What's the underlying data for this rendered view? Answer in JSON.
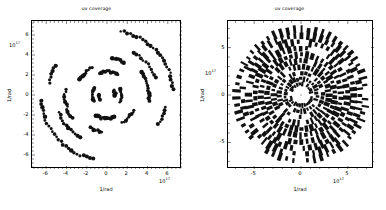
{
  "figure": {
    "background": "#ffffff",
    "marker_color": "#111111",
    "axis_color": "#000000",
    "width": 386,
    "height": 210
  },
  "panels": [
    {
      "id": "left",
      "title": "uv coverage",
      "xlabel": "1/rad",
      "ylabel": "1/rad",
      "x_exponent": "10^17",
      "y_exponent": "10^17",
      "xticks": [
        -6,
        -4,
        -2,
        0,
        2,
        4,
        6
      ],
      "yticks": [
        -6,
        -4,
        -2,
        0,
        2,
        4,
        6
      ],
      "xlim": [
        -7.4,
        7.4
      ],
      "ylim": [
        -7.4,
        7.4
      ],
      "minor_ticks_per_interval": 4,
      "ticks_all_sides": true,
      "marker_size": 1.6,
      "density": "sparse"
    },
    {
      "id": "right",
      "title": "uv coverage",
      "xlabel": "1/rad",
      "ylabel": "1/rad",
      "x_exponent": "10^17",
      "y_exponent": "10^17",
      "xticks": [
        -5,
        0,
        5
      ],
      "yticks": [
        -5,
        0,
        5
      ],
      "xlim": [
        -7.8,
        7.8
      ],
      "ylim": [
        -7.8,
        7.8
      ],
      "minor_ticks_per_interval": 4,
      "ticks_all_sides": true,
      "marker_size": 2.1,
      "density": "dense"
    }
  ],
  "chart_data": [
    {
      "type": "scatter",
      "panel": "left",
      "title": "uv coverage",
      "xlabel": "1/rad",
      "ylabel": "1/rad",
      "x_scale_exponent": 17,
      "y_scale_exponent": 17,
      "xlim": [
        -7.4,
        7.4
      ],
      "ylim": [
        -7.4,
        7.4
      ],
      "grid": false,
      "legend": null,
      "description": "Sparse uv-coverage: short arc segments distributed point-symmetrically about the origin; a large outer arc sweeps the right/upper-right, inner clusters near radius 1-3.",
      "arcs": [
        {
          "cx": 0.0,
          "cy": 0.0,
          "r": 6.55,
          "a0": 5,
          "a1": 78,
          "n": 26,
          "jitter": 0.12
        },
        {
          "cx": 0.0,
          "cy": 0.0,
          "r": 6.55,
          "a0": 185,
          "a1": 258,
          "n": 26,
          "jitter": 0.12
        },
        {
          "cx": 0.0,
          "cy": 0.0,
          "r": 5.05,
          "a0": 200,
          "a1": 238,
          "n": 12,
          "jitter": 0.12
        },
        {
          "cx": 0.0,
          "cy": 0.0,
          "r": 5.05,
          "a0": 20,
          "a1": 58,
          "n": 12,
          "jitter": 0.12
        },
        {
          "cx": 0.0,
          "cy": 0.0,
          "r": 4.15,
          "a0": 172,
          "a1": 214,
          "n": 13,
          "jitter": 0.1
        },
        {
          "cx": 0.0,
          "cy": 0.0,
          "r": 4.15,
          "a0": 352,
          "a1": 34,
          "n": 13,
          "jitter": 0.1
        },
        {
          "cx": 0.0,
          "cy": 0.0,
          "r": 3.1,
          "a0": 118,
          "a1": 150,
          "n": 9,
          "jitter": 0.1
        },
        {
          "cx": 0.0,
          "cy": 0.0,
          "r": 3.1,
          "a0": 298,
          "a1": 330,
          "n": 9,
          "jitter": 0.1
        },
        {
          "cx": 0.0,
          "cy": 0.0,
          "r": 2.35,
          "a0": 62,
          "a1": 108,
          "n": 11,
          "jitter": 0.09
        },
        {
          "cx": 0.0,
          "cy": 0.0,
          "r": 2.35,
          "a0": 242,
          "a1": 288,
          "n": 11,
          "jitter": 0.09
        },
        {
          "cx": 0.0,
          "cy": 0.0,
          "r": 1.45,
          "a0": 150,
          "a1": 205,
          "n": 9,
          "jitter": 0.08
        },
        {
          "cx": 0.0,
          "cy": 0.0,
          "r": 1.45,
          "a0": 330,
          "a1": 25,
          "n": 9,
          "jitter": 0.08
        },
        {
          "cx": 0.0,
          "cy": 0.0,
          "r": 0.8,
          "a0": 175,
          "a1": 215,
          "n": 6,
          "jitter": 0.07
        },
        {
          "cx": 0.0,
          "cy": 0.0,
          "r": 0.8,
          "a0": 355,
          "a1": 35,
          "n": 6,
          "jitter": 0.07
        },
        {
          "cx": 0.0,
          "cy": 0.0,
          "r": 5.85,
          "a0": 150,
          "a1": 168,
          "n": 7,
          "jitter": 0.1
        },
        {
          "cx": 0.0,
          "cy": 0.0,
          "r": 5.85,
          "a0": 330,
          "a1": 348,
          "n": 7,
          "jitter": 0.1
        },
        {
          "cx": 0.0,
          "cy": 0.0,
          "r": 3.7,
          "a0": 243,
          "a1": 262,
          "n": 7,
          "jitter": 0.09
        },
        {
          "cx": 0.0,
          "cy": 0.0,
          "r": 3.7,
          "a0": 63,
          "a1": 82,
          "n": 7,
          "jitter": 0.09
        }
      ],
      "point_count_estimate": 200
    },
    {
      "type": "scatter",
      "panel": "right",
      "title": "uv coverage",
      "xlabel": "1/rad",
      "ylabel": "1/rad",
      "x_scale_exponent": 17,
      "y_scale_exponent": 17,
      "xlim": [
        -7.8,
        7.8
      ],
      "ylim": [
        -7.8,
        7.8
      ],
      "grid": false,
      "legend": null,
      "description": "Dense uv-coverage: thick radially-oriented dashes arranged in concentric rings from radius ~1 out to ~7, nearly full azimuthal coverage with a small empty hole at the origin.",
      "rings": [
        {
          "r": 1.15,
          "n": 26,
          "a0": 0,
          "len": 0.38,
          "thick": 0.26
        },
        {
          "r": 1.7,
          "n": 30,
          "a0": 7,
          "len": 0.44,
          "thick": 0.28
        },
        {
          "r": 2.3,
          "n": 34,
          "a0": 3,
          "len": 0.5,
          "thick": 0.3
        },
        {
          "r": 2.95,
          "n": 38,
          "a0": 9,
          "len": 0.56,
          "thick": 0.31
        },
        {
          "r": 3.6,
          "n": 42,
          "a0": 5,
          "len": 0.6,
          "thick": 0.32
        },
        {
          "r": 4.25,
          "n": 46,
          "a0": 11,
          "len": 0.64,
          "thick": 0.33
        },
        {
          "r": 4.95,
          "n": 50,
          "a0": 4,
          "len": 0.68,
          "thick": 0.33
        },
        {
          "r": 5.6,
          "n": 54,
          "a0": 13,
          "len": 0.7,
          "thick": 0.33
        },
        {
          "r": 6.25,
          "n": 56,
          "a0": 6,
          "len": 0.72,
          "thick": 0.32
        },
        {
          "r": 6.9,
          "n": 58,
          "a0": 15,
          "len": 0.72,
          "thick": 0.3
        }
      ],
      "point_count_estimate": 2400
    }
  ]
}
